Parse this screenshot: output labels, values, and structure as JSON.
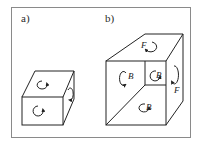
{
  "figure": {
    "panels": [
      {
        "id": "a",
        "label": "a)",
        "description": "small cube with rotation arrows on top, front and right faces",
        "face_labels": []
      },
      {
        "id": "b",
        "label": "b)",
        "description": "large cube with inner cube cut-out; faces labeled with rotation arrows",
        "face_labels": [
          {
            "face": "top",
            "text": "F"
          },
          {
            "face": "right",
            "text": "F"
          },
          {
            "face": "front-left",
            "text": "B"
          },
          {
            "face": "inner-cube",
            "text": "B"
          },
          {
            "face": "front-bottom",
            "text": "B"
          }
        ]
      }
    ]
  },
  "colors": {
    "line": "#222222",
    "frame": "#8a8a8a",
    "background": "#ffffff"
  }
}
